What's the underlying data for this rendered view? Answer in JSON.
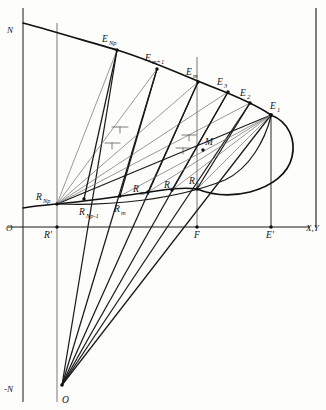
{
  "figure": {
    "background_color": "#fdfdfc",
    "ink_color": "#121212",
    "light_ink_color": "#6d6d6d"
  },
  "axes": {
    "vertical_label_top": "N",
    "vertical_label_bottom": "-N",
    "origin_label": "O",
    "horizontal_label": "X,Y"
  },
  "points": {
    "upper_curve": [
      {
        "id": "E_Np",
        "label": "E",
        "sub": "Np",
        "x": 117,
        "y": 50
      },
      {
        "id": "E_m1",
        "label": "E",
        "sub": "m+1",
        "x": 157,
        "y": 69
      },
      {
        "id": "E_m",
        "label": "E",
        "sub": "m",
        "x": 198,
        "y": 82
      },
      {
        "id": "E_3",
        "label": "E",
        "sub": "3",
        "x": 228,
        "y": 92
      },
      {
        "id": "E_2",
        "label": "E",
        "sub": "2",
        "x": 250,
        "y": 103
      },
      {
        "id": "E_1",
        "label": "E",
        "sub": "1",
        "x": 271,
        "y": 115
      }
    ],
    "lower_curve": [
      {
        "id": "R_Np",
        "label": "R",
        "sub": "Np",
        "x": 57,
        "y": 204
      },
      {
        "id": "R_Np1",
        "label": "R",
        "sub": "Np-1",
        "x": 84,
        "y": 199
      },
      {
        "id": "R_m",
        "label": "R",
        "sub": "m",
        "x": 120,
        "y": 196
      },
      {
        "id": "R_m1",
        "label": "R",
        "sub": "m-1",
        "x": 148,
        "y": 192
      },
      {
        "id": "R_2",
        "label": "R",
        "sub": "2",
        "x": 172,
        "y": 190
      },
      {
        "id": "R_1",
        "label": "R",
        "sub": "1",
        "x": 197,
        "y": 189
      }
    ],
    "special": [
      {
        "id": "M",
        "label": "M",
        "x": 203,
        "y": 150
      },
      {
        "id": "R_prime",
        "label": "R'",
        "x": 57,
        "y": 227
      },
      {
        "id": "F",
        "label": "F",
        "x": 197,
        "y": 227
      },
      {
        "id": "E_prime",
        "label": "E'",
        "x": 271,
        "y": 227
      },
      {
        "id": "Q",
        "label": "Q",
        "x": 62,
        "y": 385
      }
    ]
  },
  "labels": {
    "N_top": "N",
    "N_bottom": "-N",
    "O": "O",
    "XY": "X,Y",
    "M": "M",
    "R_prime": "R'",
    "F": "F",
    "E_prime": "E'",
    "Q": "O",
    "E_base": "E",
    "R_base": "R",
    "sub_Np": "Np",
    "sub_Np_minus_1": "Np-1",
    "sub_m": "m",
    "sub_m_plus_1": "m+1",
    "sub_m_minus_1": "m-1",
    "sub_3": "3",
    "sub_2": "2",
    "sub_1": "1"
  },
  "geometry": {
    "vertical_axis_x": 23,
    "vertical_axis_top_y": 8,
    "vertical_axis_bottom_y": 402,
    "horizontal_axis_y": 227,
    "horizontal_axis_left_x": 8,
    "horizontal_axis_right_x": 310,
    "frame_right_x": 316,
    "frame_top_y": 8,
    "pencil_vertex": {
      "x": 62,
      "y": 385
    },
    "thin_vertical_x": 57,
    "inner_vertical_x": 197
  }
}
